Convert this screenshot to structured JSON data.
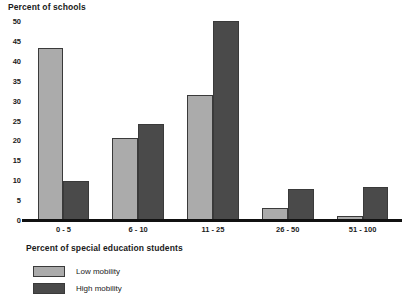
{
  "chart_data": {
    "type": "bar",
    "title": "",
    "ylabel": "Percent of schools",
    "xlabel": "Percent of special education students",
    "categories": [
      "0 - 5",
      "6 - 10",
      "11 - 25",
      "26 - 50",
      "51 - 100"
    ],
    "series": [
      {
        "name": "Low mobility",
        "color": "#ababab",
        "values": [
          43.3,
          20.5,
          31.3,
          3.0,
          1.0
        ]
      },
      {
        "name": "High mobility",
        "color": "#4a4a4a",
        "values": [
          9.8,
          24.0,
          50.0,
          7.7,
          8.2
        ]
      }
    ],
    "yticks": [
      0,
      5,
      10,
      15,
      20,
      25,
      30,
      35,
      40,
      45,
      50
    ],
    "ylim": [
      0,
      50
    ],
    "grid": false,
    "legend_position": "bottom-left"
  },
  "legend": {
    "items": [
      {
        "label": "Low mobility"
      },
      {
        "label": "High mobility"
      }
    ]
  },
  "footnote": ""
}
